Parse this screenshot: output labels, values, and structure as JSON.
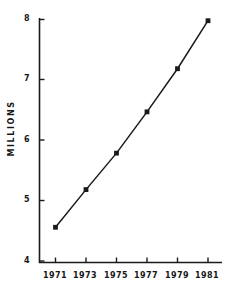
{
  "chart_data": {
    "type": "line",
    "title": "",
    "subtitle": "",
    "xlabel": "",
    "ylabel": "MILLIONS",
    "x": [
      1971,
      1973,
      1975,
      1977,
      1979,
      1981
    ],
    "categories": [
      "1971",
      "1973",
      "1975",
      "1977",
      "1979",
      "1981"
    ],
    "values": [
      4.58,
      5.2,
      5.8,
      6.48,
      7.19,
      7.98
    ],
    "series": [
      {
        "name": "Millions",
        "values": [
          4.58,
          5.2,
          5.8,
          6.48,
          7.19,
          7.98
        ]
      }
    ],
    "xlim": [
      1970,
      1982
    ],
    "ylim": [
      4,
      8
    ],
    "xticks": [
      "1971",
      "1973",
      "1975",
      "1977",
      "1979",
      "1981"
    ],
    "yticks": [
      "4",
      "5",
      "6",
      "7",
      "8"
    ],
    "ytick_values": [
      4,
      5,
      6,
      7,
      8
    ],
    "grid": false,
    "legend": false,
    "legend_position": "none",
    "marker": "square",
    "line_color": "#1a1a1a",
    "marker_color": "#1a1a1a",
    "axis_color": "#1a1a1a",
    "background_color": "#ffffff"
  }
}
